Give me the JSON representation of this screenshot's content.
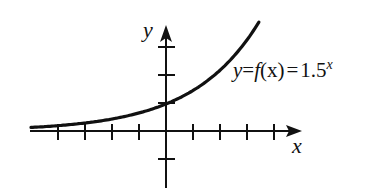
{
  "chart_data": {
    "type": "line",
    "title": "",
    "function": "1.5^x",
    "annotation": "y = f(x) = 1.5^x",
    "xlabel": "x",
    "ylabel": "y",
    "x_ticks": [
      -4,
      -3,
      -2,
      -1,
      1,
      2,
      3,
      4
    ],
    "y_ticks": [
      -1,
      1,
      2,
      3
    ],
    "xlim": [
      -5.0,
      4.8
    ],
    "ylim": [
      -2.0,
      4.2
    ],
    "grid": false,
    "tick_labels_shown": false,
    "x": [
      -5,
      -4,
      -3,
      -2,
      -1,
      0,
      1,
      2,
      3,
      3.44
    ],
    "y": [
      0.132,
      0.198,
      0.296,
      0.444,
      0.667,
      1.0,
      1.5,
      2.25,
      3.375,
      4.03
    ]
  },
  "labels": {
    "y_axis": "y",
    "x_axis": "x",
    "eq_y": "y",
    "eq_eq1": "=",
    "eq_f": "f",
    "eq_paren": "(x)",
    "eq_eq2": "=",
    "eq_base": "1.5",
    "eq_exp": "x"
  },
  "colors": {
    "ink": "#111111",
    "background": "#ffffff"
  }
}
